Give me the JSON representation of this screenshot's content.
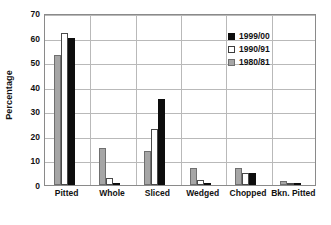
{
  "chart_data": {
    "type": "bar",
    "title": "",
    "xlabel": "",
    "ylabel": "Percentage",
    "ylim": [
      0,
      70
    ],
    "yticks": [
      0,
      10,
      20,
      30,
      40,
      50,
      60,
      70
    ],
    "ytick_labels": [
      "0",
      "10",
      "20",
      "30",
      "40",
      "50",
      "60",
      "70"
    ],
    "grid": "horizontal-and-vertical",
    "legend_position": "top-right-inside",
    "categories": [
      "Pitted",
      "Whole",
      "Sliced",
      "Wedged",
      "Chopped",
      "Bkn. Pitted"
    ],
    "series": [
      {
        "name": "1999/00",
        "color": "#0d0d0d",
        "fill": "solid-black",
        "values": [
          60,
          0.5,
          35,
          0.5,
          5,
          0.7
        ]
      },
      {
        "name": "1990/91",
        "color": "#ffffff",
        "fill": "white-outline",
        "values": [
          62,
          3,
          23,
          2,
          5,
          0.3
        ]
      },
      {
        "name": "1980/81",
        "color": "#a6a6a6",
        "fill": "gray",
        "values": [
          53,
          15,
          14,
          7,
          7,
          1.5
        ]
      }
    ],
    "series_draw_order": [
      "1980/81",
      "1990/91",
      "1999/00"
    ]
  },
  "legend": {
    "entries": [
      {
        "label": "1999/00",
        "swatch": "s-1999"
      },
      {
        "label": "1990/91",
        "swatch": "s-1990"
      },
      {
        "label": "1980/81",
        "swatch": "s-1980"
      }
    ]
  }
}
